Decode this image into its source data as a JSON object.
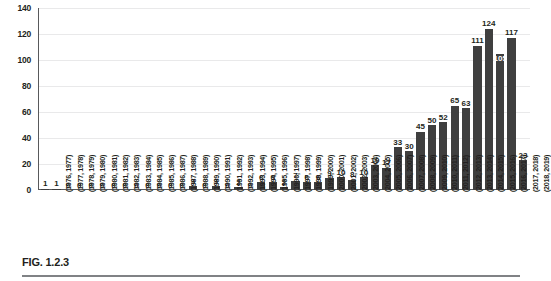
{
  "figure": {
    "caption": "FIG. 1.2.3"
  },
  "chart_data": {
    "type": "bar",
    "title": "",
    "xlabel": "",
    "ylabel": "",
    "ylim": [
      0,
      140
    ],
    "yticks": [
      0,
      20,
      40,
      60,
      80,
      100,
      120,
      140
    ],
    "grid": true,
    "legend": null,
    "bar_color": "#3f3f3f",
    "categories": [
      "(1976, 1977)",
      "(1977, 1978)",
      "(1978, 1979)",
      "(1979, 1980)",
      "(1980, 1981)",
      "(1981, 1982)",
      "(1982, 1983)",
      "(1983, 1984)",
      "(1984, 1985)",
      "(1985, 1986)",
      "(1986, 1987)",
      "(1987, 1988)",
      "(1988, 1989)",
      "(1989, 1990)",
      "(1990, 1991)",
      "(1991, 1992)",
      "(1992, 1993)",
      "(1993, 1994)",
      "(1994, 1995)",
      "(1995, 1996)",
      "(1996, 1997)",
      "(1997, 1998)",
      "(1998, 1999)",
      "(1999, 2000)",
      "(2000, 2001)",
      "(2001, 2002)",
      "(2002, 2003)",
      "(2003, 2004)",
      "(2004, 2005)",
      "(2005, 2006)",
      "(2006, 2007)",
      "(2007, 2008)",
      "(2008, 2009)",
      "(2009, 2010)",
      "(2010, 2011)",
      "(2011, 2012)",
      "(2012, 2013)",
      "(2013, 2014)",
      "(2014, 2015)",
      "(2015, 2016)",
      "(2016, 2017)",
      "(2017, 2018)",
      "(2018, 2019)"
    ],
    "values": [
      1,
      1,
      0,
      0,
      0,
      0,
      0,
      0,
      0,
      0,
      0,
      0,
      0,
      3,
      0,
      3,
      0,
      2,
      0,
      6,
      6,
      2,
      7,
      6,
      6,
      9,
      10,
      8,
      10,
      19,
      17,
      33,
      30,
      45,
      50,
      52,
      65,
      63,
      111,
      124,
      105,
      117,
      23
    ],
    "labels_inside_bar": [
      40
    ]
  }
}
